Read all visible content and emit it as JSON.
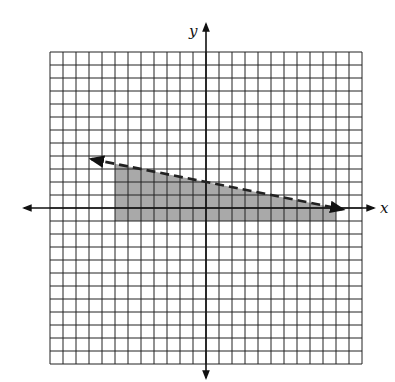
{
  "chart_data": {
    "type": "inequality-graph",
    "title": "",
    "xlabel": "x",
    "ylabel": "y",
    "xlim": [
      -12,
      12
    ],
    "ylim": [
      -12,
      12
    ],
    "grid": true,
    "grid_step": 1,
    "boundary_line": {
      "equation": "y = -x/5 + 2",
      "standard_form": "x + 5y = 10",
      "style": "dashed",
      "slope": -0.2,
      "y_intercept": 2,
      "x_intercept": 10,
      "from": [
        -8.8,
        3.76
      ],
      "to": [
        10.5,
        -0.1
      ]
    },
    "shaded_region": {
      "description": "region below dashed line, right of x = -7, above y = -1",
      "inequalities": [
        "y < -x/5 + 2",
        "x >= -7",
        "y >= -1"
      ],
      "vertices": [
        [
          -7,
          -1
        ],
        [
          -7,
          3.4
        ],
        [
          10,
          0
        ],
        [
          10,
          -1
        ]
      ],
      "color": "#9a9a9a"
    }
  },
  "labels": {
    "x_axis": "x",
    "y_axis": "y"
  },
  "colors": {
    "grid": "#222222",
    "axis": "#111111",
    "shade": "#9a9a9a",
    "background": "#ffffff"
  }
}
